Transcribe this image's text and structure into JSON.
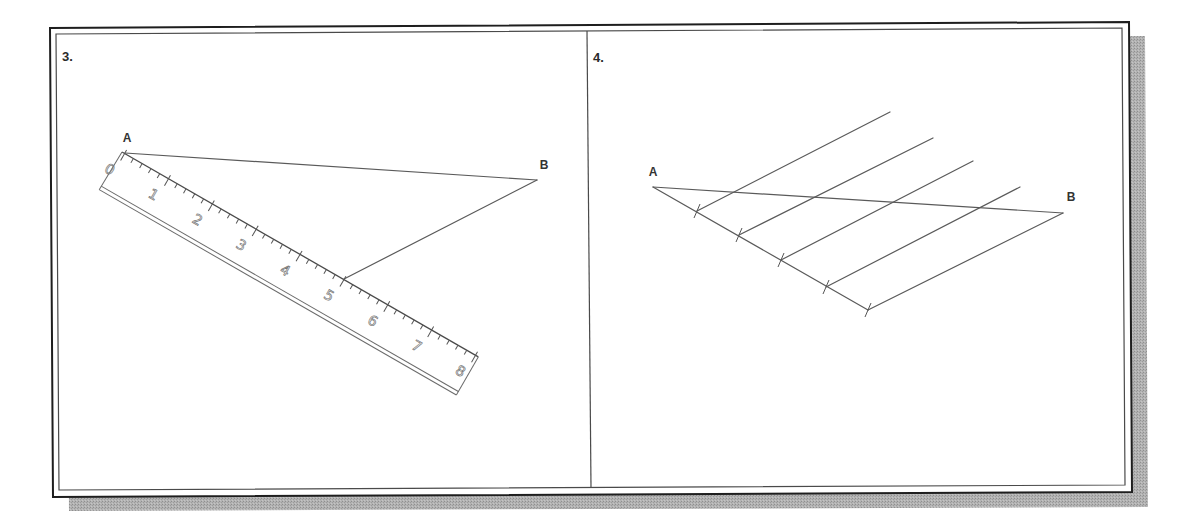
{
  "figure": {
    "panels": [
      {
        "label": "3.",
        "points": {
          "a": "A",
          "b": "B"
        },
        "ruler": {
          "labels": [
            "0",
            "1",
            "2",
            "3",
            "4",
            "5",
            "6",
            "7",
            "8"
          ],
          "inches": 8,
          "subdivisions_per_inch": 5,
          "connect_mark": "5"
        }
      },
      {
        "label": "4.",
        "points": {
          "a": "A",
          "b": "B"
        },
        "equal_divisions": 5
      }
    ],
    "colors": {
      "line": "#5a5a5a",
      "frame": "#1e1e1e",
      "shadow": "#aeaeae"
    }
  }
}
